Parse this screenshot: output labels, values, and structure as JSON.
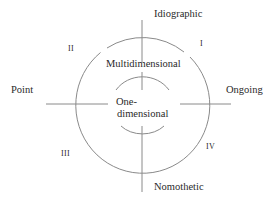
{
  "diagram": {
    "axes": {
      "top": "Idiographic",
      "bottom": "Nomothetic",
      "left": "Point",
      "right": "Ongoing"
    },
    "quadrants": {
      "q1": "I",
      "q2": "II",
      "q3": "III",
      "q4": "IV"
    },
    "rings": {
      "outer": "Multidimensional",
      "inner_line1": "One-",
      "inner_line2": "dimensional"
    },
    "colors": {
      "stroke": "#8a8a8a",
      "text": "#2a2a2a"
    }
  }
}
